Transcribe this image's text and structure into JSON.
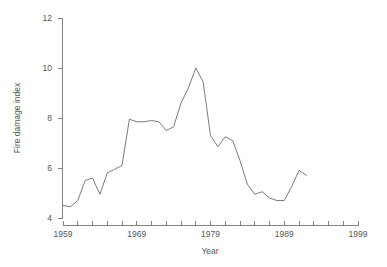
{
  "chart_data": {
    "type": "line",
    "title": "",
    "xlabel": "Year",
    "ylabel": "Fire damage index",
    "xlim": [
      1959,
      1999
    ],
    "ylim": [
      4,
      12
    ],
    "grid": false,
    "legend": null,
    "x_ticks_major": [
      1959,
      1969,
      1979,
      1989,
      1999
    ],
    "x_tick_labels": [
      "1959",
      "1969",
      "1979",
      "1989",
      "1999"
    ],
    "x_ticks_minor_step": 2,
    "y_ticks": [
      4,
      6,
      8,
      10,
      12
    ],
    "y_tick_labels": [
      "4",
      "6",
      "8",
      "10",
      "12"
    ],
    "line_color": "#6b6b6b",
    "axis_color": "#777777",
    "text_color": "#555555",
    "background_color": "#ffffff",
    "x": [
      1959,
      1960,
      1961,
      1962,
      1963,
      1964,
      1965,
      1966,
      1967,
      1968,
      1969,
      1970,
      1971,
      1972,
      1973,
      1974,
      1975,
      1976,
      1977,
      1978,
      1979,
      1980,
      1981,
      1982,
      1983,
      1984,
      1985,
      1986,
      1987,
      1988,
      1989,
      1990,
      1991,
      1992
    ],
    "values": [
      4.5,
      4.45,
      4.7,
      5.5,
      5.6,
      4.95,
      5.8,
      5.95,
      6.1,
      7.95,
      7.85,
      7.85,
      7.9,
      7.85,
      7.5,
      7.65,
      8.6,
      9.2,
      10.0,
      9.45,
      7.3,
      6.85,
      7.25,
      7.1,
      6.3,
      5.35,
      4.95,
      5.05,
      4.8,
      4.7,
      4.7,
      5.25,
      5.9,
      5.7
    ]
  }
}
